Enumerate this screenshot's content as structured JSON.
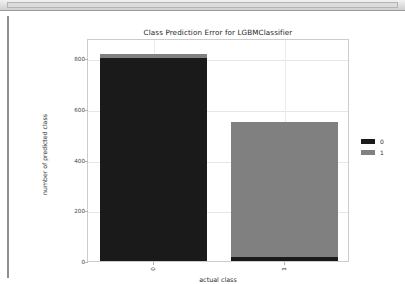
{
  "window": {
    "toolbar_strip": "",
    "left_rule": ""
  },
  "chart_data": {
    "type": "bar",
    "stacked": true,
    "title": "Class Prediction Error for LGBMClassifier",
    "xlabel": "actual class",
    "ylabel": "number of predicted class",
    "categories": [
      "0",
      "1"
    ],
    "xtick_labels": [
      "0",
      "1"
    ],
    "ytick_labels": [
      "0",
      "200",
      "400",
      "600",
      "800"
    ],
    "ytick_values": [
      0,
      200,
      400,
      600,
      800
    ],
    "ylim": [
      0,
      880
    ],
    "grid": true,
    "legend_position": "right",
    "series": [
      {
        "name": "0",
        "color": "#1a1a1a",
        "values": [
          800,
          15
        ]
      },
      {
        "name": "1",
        "color": "#808080",
        "values": [
          16,
          535
        ]
      }
    ],
    "bar_totals": [
      816,
      550
    ],
    "legend": [
      {
        "label": "0",
        "color": "#1a1a1a"
      },
      {
        "label": "1",
        "color": "#808080"
      }
    ]
  }
}
